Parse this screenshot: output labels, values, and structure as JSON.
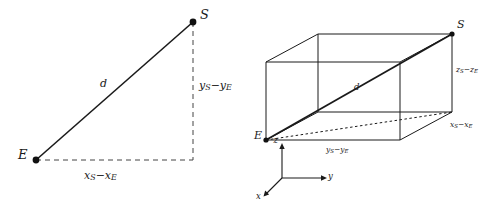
{
  "figure": {
    "title": "",
    "type": "geometry-diagram",
    "panels": [
      {
        "name": "2d-right-triangle",
        "points": {
          "start": {
            "label": "E",
            "x": 36,
            "y": 160
          },
          "end": {
            "label": "S",
            "x": 193,
            "y": 22
          }
        },
        "labels": {
          "hypotenuse": "d",
          "vertical_leg": "y",
          "vertical_leg_sub1": "S",
          "vertical_leg_minus": "−",
          "vertical_leg_2": "y",
          "vertical_leg_sub2": "E",
          "horizontal_leg": "x",
          "horizontal_leg_sub1": "S",
          "horizontal_leg_minus": "−",
          "horizontal_leg_2": "x",
          "horizontal_leg_sub2": "E"
        }
      },
      {
        "name": "3d-box",
        "points": {
          "start": {
            "label": "E"
          },
          "end": {
            "label": "S"
          }
        },
        "labels": {
          "diagonal": "d",
          "z_leg": "z_S − z_E",
          "x_leg": "x_S − x_E",
          "y_leg": "y_S − y_E"
        },
        "axes": {
          "x": "x",
          "y": "y",
          "z": "z"
        }
      }
    ],
    "colors": {
      "line": "#1a1a1a",
      "dashed": "#555555",
      "background": "#ffffff"
    }
  },
  "text": {
    "E": "E",
    "S": "S",
    "d": "d",
    "x": "x",
    "y": "y",
    "z": "z",
    "sub_S": "S",
    "sub_E": "E",
    "minus": "−"
  }
}
